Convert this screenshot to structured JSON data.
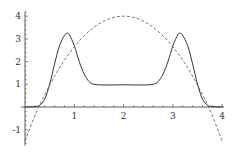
{
  "chart_data": {
    "type": "line",
    "title": "",
    "xlabel": "",
    "ylabel": "",
    "xlim": [
      0,
      4
    ],
    "ylim": [
      -1.7,
      4.2
    ],
    "grid": false,
    "legend": null,
    "x_ticks": [
      1,
      2,
      3,
      4
    ],
    "x_tick_labels": [
      "1",
      "2",
      "3",
      "4"
    ],
    "y_ticks": [
      -1,
      1,
      2,
      3,
      4
    ],
    "y_tick_labels": [
      "-1",
      "1",
      "2",
      "3",
      "4"
    ],
    "series": [
      {
        "name": "solid curve",
        "style": "solid",
        "color": "#333333",
        "x": [
          0.0,
          0.2,
          0.3,
          0.4,
          0.5,
          0.6,
          0.7,
          0.8,
          0.85,
          0.9,
          1.0,
          1.1,
          1.2,
          1.3,
          1.4,
          1.6,
          1.8,
          2.0,
          2.2,
          2.4,
          2.6,
          2.7,
          2.8,
          2.9,
          3.0,
          3.1,
          3.15,
          3.2,
          3.3,
          3.4,
          3.5,
          3.6,
          3.7,
          3.8,
          4.0
        ],
        "y": [
          0.0,
          0.02,
          0.08,
          0.35,
          1.0,
          1.9,
          2.7,
          3.15,
          3.25,
          3.18,
          2.7,
          2.0,
          1.45,
          1.12,
          1.0,
          0.97,
          0.97,
          0.98,
          0.97,
          0.97,
          1.0,
          1.12,
          1.45,
          2.0,
          2.7,
          3.18,
          3.25,
          3.15,
          2.7,
          1.9,
          1.0,
          0.35,
          0.08,
          0.02,
          0.0
        ]
      },
      {
        "name": "dashed curve",
        "style": "dashed",
        "color": "#555555",
        "x": [
          0.0,
          0.25,
          0.5,
          0.75,
          1.0,
          1.25,
          1.5,
          1.75,
          2.0,
          2.25,
          2.5,
          2.75,
          3.0,
          3.25,
          3.5,
          3.75,
          4.0
        ],
        "y": [
          -1.5,
          -0.13,
          0.96,
          1.9,
          2.65,
          3.24,
          3.66,
          3.92,
          4.0,
          3.92,
          3.66,
          3.24,
          2.65,
          1.9,
          0.96,
          -0.13,
          -1.5
        ]
      }
    ]
  },
  "axes": {
    "origin_px": {
      "x": 25,
      "y": 107
    },
    "px_per_unit_x": 49.3,
    "px_per_unit_y": 22.7,
    "axis_color": "#333333"
  }
}
